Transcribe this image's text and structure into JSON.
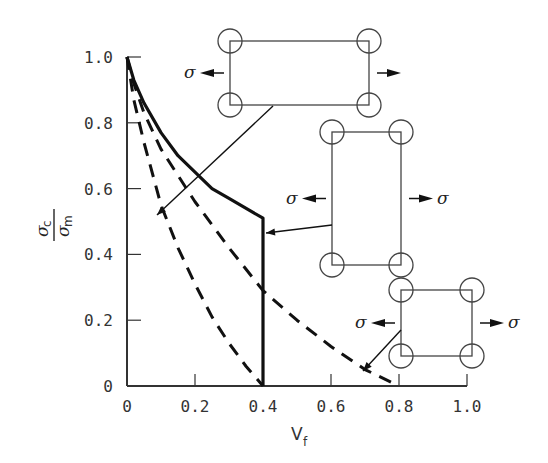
{
  "chart_data": {
    "type": "line",
    "title": "",
    "xlabel": "V_f",
    "ylabel": "σ_c / σ_m",
    "xlim": [
      0,
      1.0
    ],
    "ylim": [
      0,
      1.0
    ],
    "grid": false,
    "x_ticks": [
      "0",
      "0.2",
      "0.4",
      "0.6",
      "0.8",
      "1.0"
    ],
    "y_ticks": [
      "0",
      "0.2",
      "0.4",
      "0.6",
      "0.8",
      "1.0"
    ],
    "series": [
      {
        "name": "square array (solid)",
        "style": "solid",
        "x": [
          0,
          0.02,
          0.05,
          0.1,
          0.15,
          0.2,
          0.25,
          0.3,
          0.4,
          0.4
        ],
        "y": [
          1.0,
          0.93,
          0.86,
          0.77,
          0.7,
          0.65,
          0.6,
          0.57,
          0.51,
          0
        ]
      },
      {
        "name": "middle dashed curve",
        "style": "dashed",
        "x": [
          0,
          0.02,
          0.05,
          0.1,
          0.2,
          0.3,
          0.4,
          0.5,
          0.6,
          0.7,
          0.8
        ],
        "y": [
          1.0,
          0.92,
          0.83,
          0.72,
          0.56,
          0.42,
          0.29,
          0.2,
          0.12,
          0.05,
          0
        ]
      },
      {
        "name": "inner dashed curve",
        "style": "dashed",
        "x": [
          0,
          0.02,
          0.05,
          0.1,
          0.15,
          0.2,
          0.25,
          0.3,
          0.35,
          0.4
        ],
        "y": [
          1.0,
          0.87,
          0.74,
          0.55,
          0.42,
          0.31,
          0.21,
          0.13,
          0.06,
          0
        ]
      }
    ],
    "annotations": [
      {
        "type": "inset",
        "desc": "wide rectangular fiber arrangement under tension σ",
        "points_to": "inner dashed curve"
      },
      {
        "type": "inset",
        "desc": "tall rectangular fiber arrangement under tension σ",
        "points_to": "solid vertical drop at V_f = 0.4"
      },
      {
        "type": "inset",
        "desc": "square fiber arrangement under tension σ",
        "points_to": "middle dashed curve near V_f = 0.7"
      }
    ]
  },
  "labels": {
    "sigma": "σ",
    "y_num_sub": "c",
    "y_den_sub": "m",
    "x_main": "V",
    "x_sub": "f"
  }
}
